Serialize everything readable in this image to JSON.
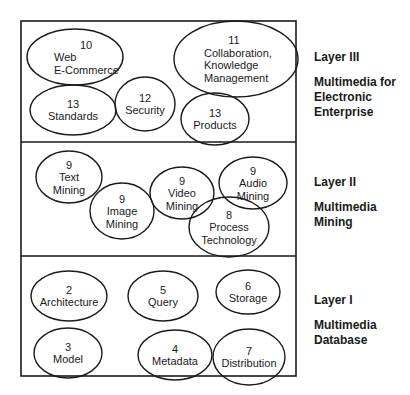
{
  "colors": {
    "stroke": "#1a1a1a",
    "text": "#1a1a1a",
    "background": "#ffffff"
  },
  "frame": {
    "x": 21,
    "y": 21,
    "width": 275,
    "height": 355,
    "dividers_y": [
      142,
      256
    ]
  },
  "layers": [
    {
      "id": "layer-3",
      "title": "Layer III",
      "description": "Multimedia for\nElectronic\nEnterprise",
      "label_top": 50,
      "nodes": [
        {
          "id": "web-ecommerce",
          "number": "10",
          "lines": [
            "Web",
            "E-Commerce"
          ],
          "cx": 75,
          "cy": 57,
          "rx": 48,
          "ry": 28,
          "text_x": 54,
          "num_x": 86,
          "align": "left"
        },
        {
          "id": "collaboration",
          "number": "11",
          "lines": [
            "Collaboration,",
            "Knowledge",
            "Management"
          ],
          "cx": 236,
          "cy": 59,
          "rx": 62,
          "ry": 38,
          "text_x": 204,
          "num_x": 234,
          "align": "left"
        },
        {
          "id": "standards",
          "number": "13",
          "lines": [
            "Standards"
          ],
          "cx": 73,
          "cy": 110,
          "rx": 43,
          "ry": 25,
          "align": "center"
        },
        {
          "id": "security",
          "number": "12",
          "lines": [
            "Security"
          ],
          "cx": 145,
          "cy": 104,
          "rx": 30,
          "ry": 27,
          "align": "center"
        },
        {
          "id": "products",
          "number": "13",
          "lines": [
            "Products"
          ],
          "cx": 215,
          "cy": 119,
          "rx": 34,
          "ry": 26,
          "align": "center"
        }
      ]
    },
    {
      "id": "layer-2",
      "title": "Layer II",
      "description": "Multimedia\nMining",
      "label_top": 175,
      "nodes": [
        {
          "id": "text-mining",
          "number": "9",
          "lines": [
            "Text",
            "Mining"
          ],
          "cx": 69,
          "cy": 177,
          "rx": 33,
          "ry": 26,
          "align": "center"
        },
        {
          "id": "image-mining",
          "number": "9",
          "lines": [
            "Image",
            "Mining"
          ],
          "cx": 122,
          "cy": 211,
          "rx": 32,
          "ry": 28,
          "align": "center"
        },
        {
          "id": "video-mining",
          "number": "9",
          "lines": [
            "Video",
            "Mining"
          ],
          "cx": 182,
          "cy": 193,
          "rx": 32,
          "ry": 26,
          "align": "center"
        },
        {
          "id": "audio-mining",
          "number": "9",
          "lines": [
            "Audio",
            "Mining"
          ],
          "cx": 253,
          "cy": 183,
          "rx": 34,
          "ry": 26,
          "align": "center"
        },
        {
          "id": "process-technology",
          "number": "8",
          "lines": [
            "Process",
            "Technology"
          ],
          "cx": 229,
          "cy": 227,
          "rx": 40,
          "ry": 30,
          "align": "center"
        }
      ]
    },
    {
      "id": "layer-1",
      "title": "Layer I",
      "description": "Multimedia\nDatabase",
      "label_top": 293,
      "nodes": [
        {
          "id": "architecture",
          "number": "2",
          "lines": [
            "Architecture"
          ],
          "cx": 69,
          "cy": 296,
          "rx": 38,
          "ry": 25,
          "align": "center"
        },
        {
          "id": "query",
          "number": "5",
          "lines": [
            "Query"
          ],
          "cx": 163,
          "cy": 296,
          "rx": 35,
          "ry": 25,
          "align": "center"
        },
        {
          "id": "storage",
          "number": "6",
          "lines": [
            "Storage"
          ],
          "cx": 248,
          "cy": 292,
          "rx": 32,
          "ry": 22,
          "align": "center"
        },
        {
          "id": "model",
          "number": "3",
          "lines": [
            "Model"
          ],
          "cx": 68,
          "cy": 353,
          "rx": 34,
          "ry": 25,
          "align": "center"
        },
        {
          "id": "metadata",
          "number": "4",
          "lines": [
            "Metadata"
          ],
          "cx": 175,
          "cy": 355,
          "rx": 37,
          "ry": 25,
          "align": "center"
        },
        {
          "id": "distribution",
          "number": "7",
          "lines": [
            "Distribution"
          ],
          "cx": 249,
          "cy": 357,
          "rx": 36,
          "ry": 28,
          "align": "center"
        }
      ]
    }
  ]
}
